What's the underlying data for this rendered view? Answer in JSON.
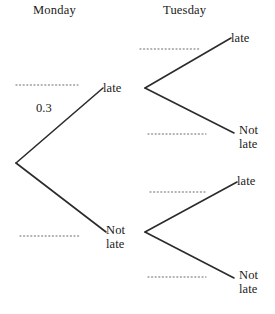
{
  "diagram": {
    "type": "probability-tree-diagram",
    "title": "",
    "stroke_color": "#2b2b2b",
    "dotted_color": "#9a9a9a",
    "background": "#ffffff",
    "columns": [
      {
        "id": "monday",
        "label": "Monday"
      },
      {
        "id": "tuesday",
        "label": "Tuesday"
      }
    ],
    "nodes": [
      {
        "id": "root",
        "label": "",
        "x": 16,
        "y": 163
      },
      {
        "id": "mon-late",
        "label": "late",
        "x": 103,
        "y": 88
      },
      {
        "id": "mon-notlate",
        "label": "Not\nlate",
        "x": 106,
        "y": 232
      },
      {
        "id": "tue-a-late",
        "label": "late",
        "x": 231,
        "y": 38
      },
      {
        "id": "tue-a-notlate",
        "label": "Not\nlate",
        "x": 239,
        "y": 133
      },
      {
        "id": "tue-b-late",
        "label": "late",
        "x": 237,
        "y": 182
      },
      {
        "id": "tue-b-notlate",
        "label": "Not\nlate",
        "x": 239,
        "y": 278
      }
    ],
    "branches": [
      {
        "id": "b-root-late",
        "from": "root",
        "to": "mon-late",
        "label": "0.3",
        "label_shown": true
      },
      {
        "id": "b-root-notlate",
        "from": "root",
        "to": "mon-notlate",
        "label": "",
        "label_shown": false
      },
      {
        "id": "b-late-late",
        "from": "mon-late",
        "to": "tue-a-late",
        "label": "",
        "label_shown": false
      },
      {
        "id": "b-late-notlate",
        "from": "mon-late",
        "to": "tue-a-notlate",
        "label": "",
        "label_shown": false
      },
      {
        "id": "b-not-late",
        "from": "mon-notlate",
        "to": "tue-b-late",
        "label": "",
        "label_shown": false
      },
      {
        "id": "b-not-notlate",
        "from": "mon-notlate",
        "to": "tue-b-notlate",
        "label": "",
        "label_shown": false
      }
    ],
    "blank_lines": [
      {
        "id": "blank-mon-late",
        "x1": 16,
        "x2": 78,
        "y": 85
      },
      {
        "id": "blank-mon-notlate",
        "x1": 20,
        "x2": 81,
        "y": 236
      },
      {
        "id": "blank-tue-a-late",
        "x1": 140,
        "x2": 200,
        "y": 49
      },
      {
        "id": "blank-tue-a-notlate",
        "x1": 148,
        "x2": 206,
        "y": 134
      },
      {
        "id": "blank-tue-b-late",
        "x1": 150,
        "x2": 207,
        "y": 192
      },
      {
        "id": "blank-tue-b-notlate",
        "x1": 148,
        "x2": 206,
        "y": 277
      }
    ]
  },
  "labels": {
    "monday_header": "Monday",
    "tuesday_header": "Tuesday",
    "mon_late": "late",
    "mon_not_late": "Not\nlate",
    "tue_a_late": "late",
    "tue_a_not_late": "Not\nlate",
    "tue_b_late": "late",
    "tue_b_not_late": "Not\nlate",
    "prob_mon_late": "0.3"
  }
}
